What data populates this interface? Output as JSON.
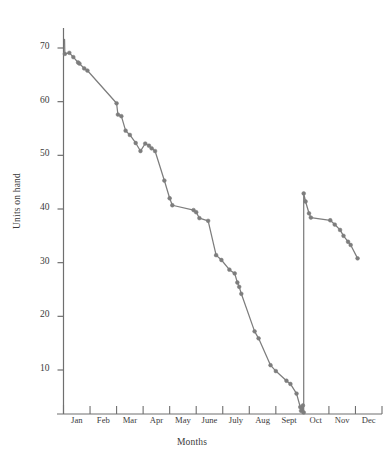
{
  "chart_data": {
    "type": "line",
    "title": "",
    "subtitle": "",
    "xlabel": "Months",
    "ylabel": "Units on hand",
    "grid": false,
    "legend": "none",
    "xlim": [
      0,
      12
    ],
    "ylim": [
      0,
      74
    ],
    "ytick_values": [
      10,
      20,
      30,
      40,
      50,
      60,
      70
    ],
    "ytick_labels": [
      "10",
      "20",
      "30",
      "40",
      "50",
      "60",
      "70"
    ],
    "categories": [
      "Jan",
      "Feb",
      "Mar",
      "Apr",
      "May",
      "June",
      "July",
      "Aug",
      "Sept",
      "Oct",
      "Nov",
      "Dec"
    ],
    "annotations": [
      "Vertical restock jump between Sept and Oct: level rises from about 2 units to about 43 units"
    ],
    "series": [
      {
        "name": "Units on hand",
        "color": "#7d7d7d",
        "marker": "circle",
        "points": [
          {
            "x": 0.04,
            "y": 71.6
          },
          {
            "x": 0.05,
            "y": 68.9
          },
          {
            "x": 0.22,
            "y": 69.1
          },
          {
            "x": 0.37,
            "y": 68.3
          },
          {
            "x": 0.55,
            "y": 67.3
          },
          {
            "x": 0.6,
            "y": 67.1
          },
          {
            "x": 0.78,
            "y": 66.2
          },
          {
            "x": 0.9,
            "y": 65.8
          },
          {
            "x": 2.0,
            "y": 59.7
          },
          {
            "x": 2.05,
            "y": 57.6
          },
          {
            "x": 2.18,
            "y": 57.3
          },
          {
            "x": 2.34,
            "y": 54.6
          },
          {
            "x": 2.5,
            "y": 53.8
          },
          {
            "x": 2.72,
            "y": 52.3
          },
          {
            "x": 2.9,
            "y": 50.8
          },
          {
            "x": 3.08,
            "y": 52.2
          },
          {
            "x": 3.22,
            "y": 51.8
          },
          {
            "x": 3.32,
            "y": 51.3
          },
          {
            "x": 3.45,
            "y": 50.8
          },
          {
            "x": 3.8,
            "y": 45.3
          },
          {
            "x": 4.0,
            "y": 42.0
          },
          {
            "x": 4.1,
            "y": 40.7
          },
          {
            "x": 4.9,
            "y": 39.8
          },
          {
            "x": 5.0,
            "y": 39.4
          },
          {
            "x": 5.12,
            "y": 38.3
          },
          {
            "x": 5.45,
            "y": 37.8
          },
          {
            "x": 5.75,
            "y": 31.4
          },
          {
            "x": 5.95,
            "y": 30.5
          },
          {
            "x": 6.25,
            "y": 28.7
          },
          {
            "x": 6.45,
            "y": 28.0
          },
          {
            "x": 6.55,
            "y": 26.3
          },
          {
            "x": 6.62,
            "y": 25.5
          },
          {
            "x": 6.7,
            "y": 24.2
          },
          {
            "x": 7.2,
            "y": 17.2
          },
          {
            "x": 7.35,
            "y": 15.9
          },
          {
            "x": 7.8,
            "y": 10.9
          },
          {
            "x": 8.0,
            "y": 9.8
          },
          {
            "x": 8.4,
            "y": 8.0
          },
          {
            "x": 8.55,
            "y": 7.4
          },
          {
            "x": 8.78,
            "y": 5.6
          },
          {
            "x": 8.92,
            "y": 3.1
          },
          {
            "x": 8.95,
            "y": 2.4
          },
          {
            "x": 9.02,
            "y": 3.4
          },
          {
            "x": 9.05,
            "y": 2.1
          },
          {
            "x": 9.05,
            "y": 42.9
          },
          {
            "x": 9.12,
            "y": 41.4
          },
          {
            "x": 9.25,
            "y": 39.2
          },
          {
            "x": 9.32,
            "y": 38.4
          },
          {
            "x": 10.05,
            "y": 37.9
          },
          {
            "x": 10.22,
            "y": 37.1
          },
          {
            "x": 10.42,
            "y": 36.1
          },
          {
            "x": 10.55,
            "y": 35.0
          },
          {
            "x": 10.72,
            "y": 33.9
          },
          {
            "x": 10.82,
            "y": 33.3
          },
          {
            "x": 11.08,
            "y": 30.8
          }
        ]
      }
    ]
  },
  "axes": {
    "yaxis_name": "units-on-hand-axis",
    "xaxis_name": "months-axis"
  }
}
